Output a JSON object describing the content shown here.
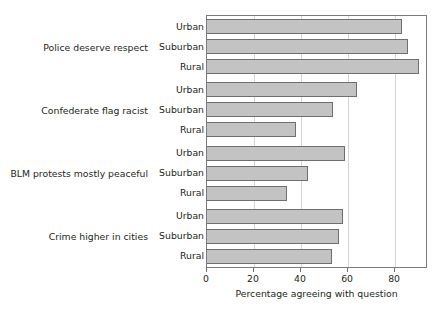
{
  "chart_data": {
    "type": "bar",
    "orientation": "horizontal",
    "title": "",
    "xlabel": "Percentage agreeing with question",
    "ylabel": "",
    "xlim": [
      0,
      94
    ],
    "xticks": [
      0,
      20,
      40,
      60,
      80
    ],
    "xtick_labels": [
      "0",
      "20",
      "40",
      "60",
      "80"
    ],
    "grid": "vertical",
    "legend": "none",
    "group_label_key": "question",
    "categories": [
      "Urban",
      "Suburban",
      "Rural"
    ],
    "groups": [
      {
        "question": "Police deserve respect",
        "bars": [
          {
            "category": "Urban",
            "value": 83
          },
          {
            "category": "Suburban",
            "value": 85.5
          },
          {
            "category": "Rural",
            "value": 90
          }
        ]
      },
      {
        "question": "Confederate flag racist",
        "bars": [
          {
            "category": "Urban",
            "value": 64
          },
          {
            "category": "Suburban",
            "value": 53.5
          },
          {
            "category": "Rural",
            "value": 38
          }
        ]
      },
      {
        "question": "BLM protests mostly peaceful",
        "bars": [
          {
            "category": "Urban",
            "value": 58.5
          },
          {
            "category": "Suburban",
            "value": 43
          },
          {
            "category": "Rural",
            "value": 34
          }
        ]
      },
      {
        "question": "Crime higher in cities",
        "bars": [
          {
            "category": "Urban",
            "value": 58
          },
          {
            "category": "Suburban",
            "value": 56
          },
          {
            "category": "Rural",
            "value": 53
          }
        ]
      }
    ],
    "colors": {
      "bar_fill": "#c3c3c3",
      "bar_border": "#6f6f6f",
      "grid": "#d4d4d4",
      "axis": "#7b7b7b",
      "text": "#231f20",
      "background": "#ffffff"
    }
  }
}
